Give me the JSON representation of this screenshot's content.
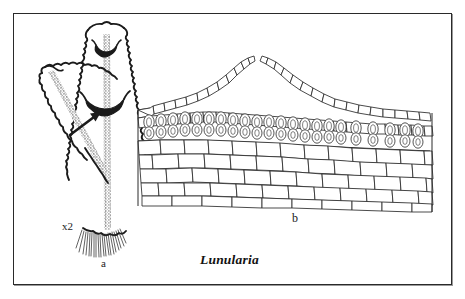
{
  "figure": {
    "caption": "Lunularia",
    "frame_color": "#2a2a2a",
    "background": "#ffffff",
    "ink_color": "#1b1b1b"
  },
  "panels": [
    {
      "id": "a",
      "label": "a",
      "magnification_label": "x2",
      "description": "Habit sketch of Lunularia thallus with branching lobes, crescent-shaped gemma cups and basal rhizoids",
      "features": [
        "thallus-main-branch",
        "thallus-left-branch",
        "gemma-cup-apical",
        "gemma-cup-mid",
        "pointer-arrow",
        "rhizoid-tuft",
        "midrib-stipple"
      ]
    },
    {
      "id": "b",
      "label": "b",
      "description": "Vertical section through a gemma cup showing flanking cell chains, stalked gemmae and multilayered thallus parenchyma",
      "features": [
        "cup-wall-left",
        "cup-wall-right",
        "gemma-row",
        "epidermis-layer",
        "parenchyma-layers"
      ]
    }
  ],
  "annotations": {
    "arrow_target": "gemma-cup-mid",
    "gemma_count": 17,
    "parenchyma_rows": 5
  }
}
